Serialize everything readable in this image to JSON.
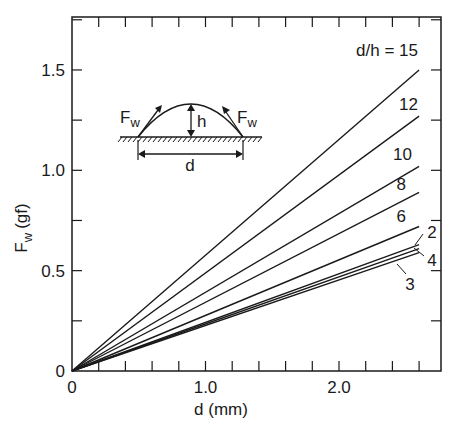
{
  "chart_data": {
    "type": "line",
    "title": "",
    "xlabel": "d (mm)",
    "ylabel": "F_w (gf)",
    "ylabel_main": "F",
    "ylabel_sub": "w",
    "ylabel_unit": "(gf)",
    "xlim": [
      0,
      2.75
    ],
    "ylim": [
      0,
      1.76
    ],
    "x_ticks_major": [
      0,
      1.0,
      2.0
    ],
    "x_tick_labels": [
      "0",
      "1.0",
      "2.0"
    ],
    "x_minor_step": 0.2,
    "y_ticks_major": [
      0,
      0.5,
      1.0,
      1.5
    ],
    "y_tick_labels": [
      "0",
      "0.5",
      "1.0",
      "1.5"
    ],
    "y_minor_step": 0.25,
    "grid": false,
    "legend_title": "d/h",
    "series": [
      {
        "name": "d/h = 15",
        "label": "d/h = 15",
        "x": [
          0,
          2.6
        ],
        "values": [
          0,
          1.5
        ]
      },
      {
        "name": "d/h = 12",
        "label": "12",
        "x": [
          0,
          2.6
        ],
        "values": [
          0,
          1.27
        ]
      },
      {
        "name": "d/h = 10",
        "label": "10",
        "x": [
          0,
          2.6
        ],
        "values": [
          0,
          1.02
        ]
      },
      {
        "name": "d/h = 8",
        "label": "8",
        "x": [
          0,
          2.6
        ],
        "values": [
          0,
          0.89
        ]
      },
      {
        "name": "d/h = 6",
        "label": "6",
        "x": [
          0,
          2.6
        ],
        "values": [
          0,
          0.72
        ]
      },
      {
        "name": "d/h = 2",
        "label": "2",
        "x": [
          0,
          2.6
        ],
        "values": [
          0,
          0.63
        ]
      },
      {
        "name": "d/h = 4",
        "label": "4",
        "x": [
          0,
          2.6
        ],
        "values": [
          0,
          0.61
        ]
      },
      {
        "name": "d/h = 3",
        "label": "3",
        "x": [
          0,
          2.6
        ],
        "values": [
          0,
          0.59
        ]
      }
    ],
    "annotations": {
      "inset": {
        "description": "Droplet/arch cross-section of width d and height h on a hatched surface, with tangential forces F_w at both contact points",
        "labels": [
          "F_w",
          "h",
          "F_w",
          "d"
        ]
      }
    }
  },
  "labels": {
    "x_axis_title": "d (mm)",
    "y_axis_F": "F",
    "y_axis_w": "w",
    "y_axis_unit": "(gf)",
    "inset_F": "F",
    "inset_w": "w",
    "inset_h": "h",
    "inset_d": "d"
  },
  "colors": {
    "line": "#1a1a1a",
    "background": "#ffffff"
  }
}
